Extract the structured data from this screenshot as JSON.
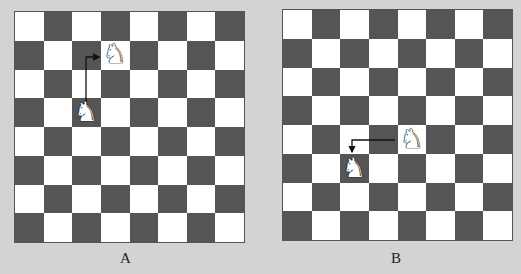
{
  "boards": [
    {
      "id": "A",
      "label": "A",
      "size": 8,
      "top_left_color": "light",
      "knights": [
        {
          "col": 2,
          "row": 3,
          "role": "start"
        },
        {
          "col": 3,
          "row": 1,
          "role": "end"
        }
      ],
      "move_path": "up two, right one"
    },
    {
      "id": "B",
      "label": "B",
      "size": 8,
      "top_left_color": "light",
      "knights": [
        {
          "col": 4,
          "row": 4,
          "role": "start"
        },
        {
          "col": 2,
          "row": 5,
          "role": "end"
        }
      ],
      "move_path": "left two, down one"
    }
  ],
  "colors": {
    "light": "#ffffff",
    "dark": "#555555",
    "background": "#d3d3d3",
    "arrow": "#111111"
  },
  "knight_glyph": "♘"
}
